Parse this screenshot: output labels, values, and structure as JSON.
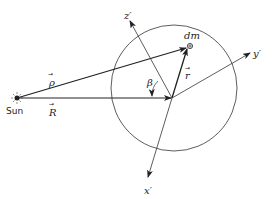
{
  "diagram": {
    "labels": {
      "sun": "Sun",
      "rho": "ρ",
      "R": "R",
      "r": "r",
      "beta": "β",
      "dm": "dm",
      "x_axis": "x′",
      "y_axis": "y′",
      "z_axis": "z′",
      "vec_arrow": "→"
    },
    "colors": {
      "line": "#222222",
      "background": "#ffffff"
    }
  }
}
